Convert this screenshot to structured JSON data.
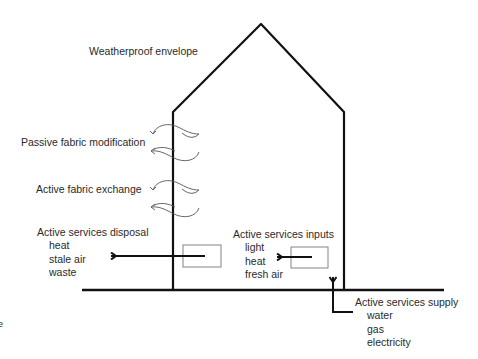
{
  "diagram": {
    "title_label": "Weatherproof envelope",
    "passive_label": "Passive fabric modification",
    "active_fabric_label": "Active fabric exchange",
    "disposal": {
      "title": "Active services disposal",
      "items": [
        "heat",
        "stale air",
        "waste"
      ]
    },
    "inputs": {
      "title": "Active services inputs",
      "items": [
        "light",
        "heat",
        "fresh air"
      ]
    },
    "supply": {
      "title": "Active services supply",
      "items": [
        "water",
        "gas",
        "electricity"
      ]
    },
    "edge_fragment": "e",
    "colors": {
      "line": "#111111",
      "text": "#2a2a2a",
      "box": "#777777"
    }
  }
}
